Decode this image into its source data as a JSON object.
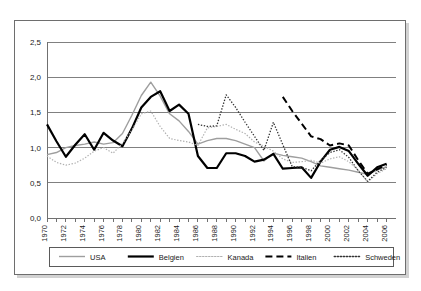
{
  "chart_data": {
    "type": "line",
    "title": "",
    "subtitle": "",
    "xlabel": "",
    "ylabel": "",
    "xlim": [
      1970,
      2007
    ],
    "ylim": [
      0.0,
      2.5
    ],
    "grid": true,
    "legend_position": "bottom",
    "y_ticks": [
      "0,0",
      "0,5",
      "1,0",
      "1,5",
      "2,0",
      "2,5"
    ],
    "y_tick_values": [
      0.0,
      0.5,
      1.0,
      1.5,
      2.0,
      2.5
    ],
    "x_tick_labels": [
      "1970",
      "1972",
      "1974",
      "1976",
      "1978",
      "1980",
      "1982",
      "1984",
      "1986",
      "1988",
      "1990",
      "1992",
      "1994",
      "1996",
      "1998",
      "2000",
      "2002",
      "2004",
      "2006"
    ],
    "x_tick_values": [
      1970,
      1972,
      1974,
      1976,
      1978,
      1980,
      1982,
      1984,
      1986,
      1988,
      1990,
      1992,
      1994,
      1996,
      1998,
      2000,
      2002,
      2004,
      2006
    ],
    "x_minor_ticks": [
      1970,
      1971,
      1972,
      1973,
      1974,
      1975,
      1976,
      1977,
      1978,
      1979,
      1980,
      1981,
      1982,
      1983,
      1984,
      1985,
      1986,
      1987,
      1988,
      1989,
      1990,
      1991,
      1992,
      1993,
      1994,
      1995,
      1996,
      1997,
      1998,
      1999,
      2000,
      2001,
      2002,
      2003,
      2004,
      2005,
      2006
    ],
    "series": [
      {
        "name": "USA",
        "style": "solid",
        "color": "#9e9e9e",
        "width": 1.4,
        "x": [
          1970,
          1971,
          1972,
          1973,
          1974,
          1975,
          1976,
          1977,
          1978,
          1979,
          1980,
          1981,
          1982,
          1983,
          1984,
          1985,
          1986,
          1987,
          1988,
          1989,
          1990,
          1991,
          1992,
          1993,
          1994,
          1995,
          1996,
          1997,
          1998,
          1999,
          2000,
          2001,
          2002,
          2003,
          2004,
          2005,
          2006
        ],
        "values": [
          0.9,
          0.93,
          1.0,
          1.03,
          1.05,
          1.08,
          1.05,
          1.07,
          1.2,
          1.46,
          1.74,
          1.93,
          1.73,
          1.48,
          1.38,
          1.23,
          1.05,
          1.1,
          1.13,
          1.13,
          1.1,
          1.05,
          1.0,
          0.81,
          0.92,
          0.89,
          0.87,
          0.85,
          0.8,
          0.74,
          0.72,
          0.7,
          0.68,
          0.65,
          0.62,
          0.68,
          0.73
        ]
      },
      {
        "name": "Belgien",
        "style": "solid",
        "color": "#000000",
        "width": 2.2,
        "x": [
          1970,
          1971,
          1972,
          1973,
          1974,
          1975,
          1976,
          1977,
          1978,
          1979,
          1980,
          1981,
          1982,
          1983,
          1984,
          1985,
          1986,
          1987,
          1988,
          1989,
          1990,
          1991,
          1992,
          1993,
          1994,
          1995,
          1996,
          1997,
          1998,
          1999,
          2000,
          2001,
          2002,
          2003,
          2004,
          2005,
          2006
        ],
        "values": [
          1.33,
          1.09,
          0.87,
          1.04,
          1.19,
          0.97,
          1.21,
          1.1,
          1.02,
          1.27,
          1.57,
          1.72,
          1.8,
          1.52,
          1.61,
          1.48,
          0.88,
          0.71,
          0.71,
          0.92,
          0.92,
          0.88,
          0.8,
          0.83,
          0.91,
          0.7,
          0.71,
          0.72,
          0.57,
          0.8,
          0.97,
          1.01,
          0.95,
          0.77,
          0.6,
          0.72,
          0.77
        ]
      },
      {
        "name": "Kanada",
        "style": "dotted-light",
        "color": "#b0b0b0",
        "width": 1.2,
        "x": [
          1970,
          1971,
          1972,
          1973,
          1974,
          1975,
          1976,
          1977,
          1978,
          1979,
          1980,
          1981,
          1982,
          1983,
          1984,
          1985,
          1986,
          1987,
          1988,
          1989,
          1990,
          1991,
          1992,
          1993,
          1994,
          1995,
          1996,
          1997,
          1998,
          1999,
          2000,
          2001,
          2002,
          2003,
          2004,
          2005,
          2006
        ],
        "values": [
          0.88,
          0.79,
          0.75,
          0.78,
          0.85,
          0.95,
          1.0,
          0.92,
          1.06,
          1.25,
          1.48,
          1.52,
          1.3,
          1.13,
          1.1,
          1.08,
          1.03,
          1.28,
          1.3,
          1.33,
          1.26,
          1.2,
          1.08,
          1.02,
          0.95,
          0.84,
          0.79,
          0.8,
          0.82,
          0.78,
          0.84,
          0.87,
          0.8,
          0.68,
          0.51,
          0.63,
          0.7
        ]
      },
      {
        "name": "Italien",
        "style": "dashed",
        "color": "#000000",
        "width": 2.0,
        "x": [
          1995,
          1996,
          1997,
          1998,
          1999,
          2000,
          2001,
          2002,
          2003,
          2004,
          2005,
          2006
        ],
        "values": [
          1.72,
          1.52,
          1.34,
          1.16,
          1.12,
          1.03,
          1.06,
          1.03,
          0.82,
          0.63,
          0.69,
          0.76
        ]
      },
      {
        "name": "Schweden",
        "style": "dotted-dark",
        "color": "#333333",
        "width": 1.3,
        "x": [
          1986,
          1987,
          1988,
          1989,
          1990,
          1991,
          1992,
          1993,
          1994,
          1995,
          1996,
          1997,
          1998,
          1999,
          2000,
          2001,
          2002,
          2003,
          2004,
          2005,
          2006
        ],
        "values": [
          1.33,
          1.3,
          1.31,
          1.75,
          1.57,
          1.36,
          1.16,
          0.96,
          1.36,
          1.04,
          0.73,
          0.72,
          0.67,
          0.82,
          0.93,
          0.97,
          0.86,
          0.67,
          0.52,
          0.65,
          0.72
        ]
      }
    ]
  },
  "legend": {
    "entries": [
      {
        "label": "USA"
      },
      {
        "label": "Belgien"
      },
      {
        "label": "Kanada"
      },
      {
        "label": "Italien"
      },
      {
        "label": "Schweden"
      }
    ]
  }
}
